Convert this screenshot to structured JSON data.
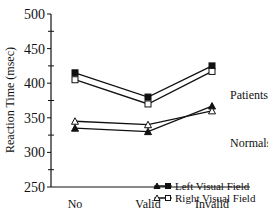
{
  "chart_data": {
    "type": "line",
    "title": "",
    "xlabel": "",
    "ylabel": "Reaction Time (msec)",
    "ylim": [
      250,
      500
    ],
    "yticks": [
      250,
      300,
      350,
      400,
      450,
      500
    ],
    "categories": [
      "No",
      "Valid",
      "Invalid"
    ],
    "grid": false,
    "series": [
      {
        "name": "Patients - Left Visual Field",
        "group": "Patients",
        "field": "Left Visual Field",
        "marker": "filled-square",
        "values": [
          415,
          380,
          425
        ]
      },
      {
        "name": "Patients - Right Visual Field",
        "group": "Patients",
        "field": "Right Visual Field",
        "marker": "open-square",
        "values": [
          405,
          370,
          417
        ]
      },
      {
        "name": "Normals - Left Visual Field",
        "group": "Normals",
        "field": "Left Visual Field",
        "marker": "filled-triangle",
        "values": [
          335,
          330,
          367
        ]
      },
      {
        "name": "Normals - Right Visual Field",
        "group": "Normals",
        "field": "Right Visual Field",
        "marker": "open-triangle",
        "values": [
          345,
          340,
          360
        ]
      }
    ],
    "annotations": [
      "Patients",
      "Normals"
    ],
    "legend": {
      "position": "lower-right",
      "entries": [
        "Left Visual Field",
        "Right Visual Field"
      ]
    }
  }
}
